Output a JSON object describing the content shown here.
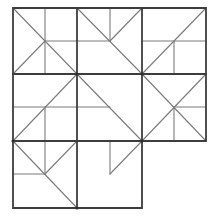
{
  "figure": {
    "type": "tiling-puzzle",
    "colors": {
      "background": "#ffffff",
      "grid_stroke": "#3d3d3d",
      "inner_stroke": "#7a7a7a",
      "node_fill": "#2f2f2f"
    },
    "grid": {
      "columns_x": [
        13,
        77,
        142,
        206
      ],
      "rows_y": [
        8,
        74,
        141,
        208
      ],
      "missing_cell": {
        "row": 2,
        "col": 2
      }
    },
    "outline": [
      [
        13,
        8
      ],
      [
        206,
        8
      ],
      [
        206,
        141
      ],
      [
        142,
        141
      ],
      [
        142,
        208
      ],
      [
        13,
        208
      ]
    ],
    "grid_segments": [
      [
        77,
        8,
        77,
        208
      ],
      [
        142,
        8,
        142,
        141
      ],
      [
        13,
        74,
        206,
        74
      ],
      [
        13,
        141,
        142,
        141
      ]
    ],
    "cells": [
      {
        "id": "r0c0",
        "segments": [
          [
            13,
            8,
            77,
            74
          ],
          [
            45,
            41,
            13,
            74
          ],
          [
            45,
            8,
            45,
            74
          ],
          [
            45,
            41,
            77,
            41
          ]
        ]
      },
      {
        "id": "r0c1",
        "segments": [
          [
            77,
            8,
            142,
            74
          ],
          [
            110,
            8,
            110,
            41
          ],
          [
            77,
            41,
            110,
            41
          ],
          [
            110,
            41,
            142,
            8
          ]
        ]
      },
      {
        "id": "r0c2",
        "segments": [
          [
            142,
            74,
            206,
            8
          ],
          [
            142,
            41,
            206,
            41
          ],
          [
            174,
            41,
            174,
            74
          ]
        ]
      },
      {
        "id": "r1c0",
        "segments": [
          [
            13,
            141,
            77,
            74
          ],
          [
            13,
            107,
            77,
            107
          ],
          [
            45,
            107,
            45,
            141
          ]
        ]
      },
      {
        "id": "r1c1",
        "segments": [
          [
            77,
            74,
            142,
            141
          ],
          [
            77,
            107,
            110,
            107
          ]
        ]
      },
      {
        "id": "r1c2",
        "segments": [
          [
            142,
            74,
            206,
            141
          ],
          [
            142,
            141,
            206,
            74
          ],
          [
            174,
            107,
            206,
            107
          ],
          [
            174,
            107,
            174,
            141
          ]
        ]
      },
      {
        "id": "r2c0",
        "segments": [
          [
            13,
            141,
            77,
            208
          ],
          [
            45,
            141,
            45,
            174
          ],
          [
            13,
            174,
            45,
            174
          ],
          [
            45,
            174,
            77,
            141
          ]
        ]
      },
      {
        "id": "r2c1",
        "segments": [
          [
            110,
            141,
            110,
            174
          ],
          [
            110,
            174,
            142,
            141
          ]
        ]
      }
    ],
    "nodes": [
      [
        77,
        74
      ],
      [
        142,
        74
      ],
      [
        13,
        141
      ],
      [
        142,
        141
      ],
      [
        77,
        208
      ]
    ]
  }
}
